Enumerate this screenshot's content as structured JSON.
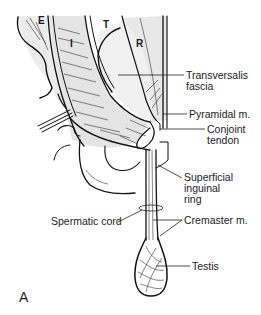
{
  "figure": {
    "panel_label": "A",
    "muscle_letters": {
      "external_oblique": "E",
      "internal_oblique": "I",
      "transversus": "T",
      "rectus": "R"
    },
    "labels": [
      {
        "id": "transversalis-fascia",
        "lines": [
          "Transversalis",
          "fascia"
        ]
      },
      {
        "id": "pyramidal-muscle",
        "lines": [
          "Pyramidal m."
        ]
      },
      {
        "id": "conjoint-tendon",
        "lines": [
          "Conjoint",
          "tendon"
        ]
      },
      {
        "id": "superficial-inguinal-ring",
        "lines": [
          "Superficial",
          "inguinal",
          "ring"
        ]
      },
      {
        "id": "spermatic-cord",
        "lines": [
          "Spermatic cord"
        ]
      },
      {
        "id": "cremaster-muscle",
        "lines": [
          "Cremaster m."
        ]
      },
      {
        "id": "testis",
        "lines": [
          "Testis"
        ]
      }
    ],
    "colors": {
      "ink": "#111111",
      "shade": "#e6e6e6",
      "background": "#ffffff"
    }
  }
}
